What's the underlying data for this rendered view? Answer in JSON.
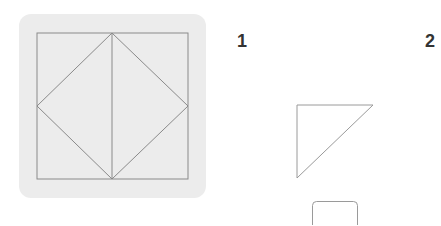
{
  "puzzle": {
    "main_figure": {
      "description": "square with inscribed diamond and vertical center line",
      "line_color": "#8a8a8a",
      "panel_color": "#ececec"
    },
    "options": [
      {
        "label": "1",
        "shape": "right-triangle"
      },
      {
        "label": "2",
        "shape": "rounded-rectangle"
      }
    ]
  }
}
